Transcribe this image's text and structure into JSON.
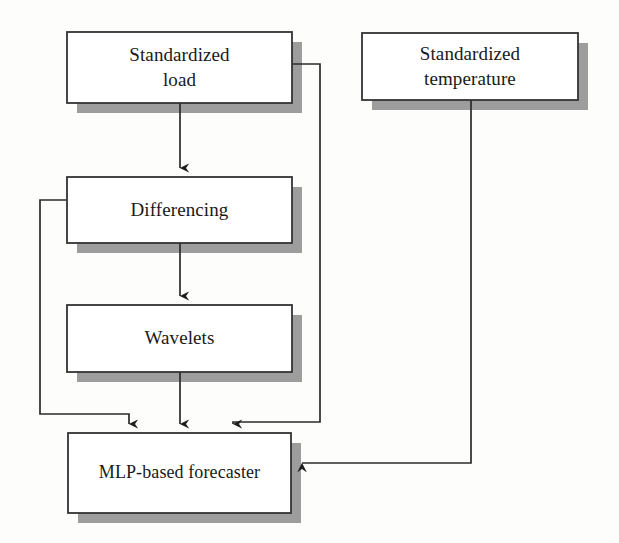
{
  "diagram": {
    "type": "flowchart",
    "background_color": "#fdfdfc",
    "box_fill_color": "#ffffff",
    "box_border_color": "#333333",
    "shadow_color": "#9a9a9a",
    "connector_color": "#2b2b2b",
    "nodes": [
      {
        "id": "standardized-load",
        "label": "Standardized\nload",
        "x": 67,
        "y": 32,
        "width": 225,
        "height": 71
      },
      {
        "id": "standardized-temperature",
        "label": "Standardized\ntemperature",
        "x": 362,
        "y": 33,
        "width": 216,
        "height": 67
      },
      {
        "id": "differencing",
        "label": "Differencing",
        "x": 67,
        "y": 177,
        "width": 225,
        "height": 66
      },
      {
        "id": "wavelets",
        "label": "Wavelets",
        "x": 67,
        "y": 305,
        "width": 225,
        "height": 67
      },
      {
        "id": "mlp-based-forecaster",
        "label": "MLP-based forecaster",
        "x": 68,
        "y": 433,
        "width": 223,
        "height": 80
      }
    ],
    "edges": [
      {
        "id": "load-to-differencing",
        "from": "standardized-load",
        "to": "differencing",
        "arrow": "down"
      },
      {
        "id": "load-to-forecaster",
        "from": "standardized-load",
        "to": "mlp-based-forecaster",
        "arrow": "down"
      },
      {
        "id": "differencing-to-wavelets",
        "from": "differencing",
        "to": "wavelets",
        "arrow": "down"
      },
      {
        "id": "differencing-to-forecaster",
        "from": "differencing",
        "to": "mlp-based-forecaster",
        "arrow": "down"
      },
      {
        "id": "wavelets-to-forecaster",
        "from": "wavelets",
        "to": "mlp-based-forecaster",
        "arrow": "down"
      },
      {
        "id": "temperature-to-forecaster",
        "from": "standardized-temperature",
        "to": "mlp-based-forecaster",
        "arrow": "left"
      }
    ]
  }
}
